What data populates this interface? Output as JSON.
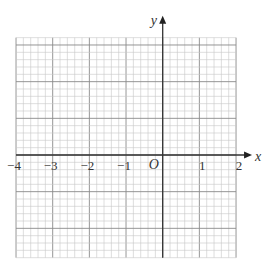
{
  "diagram": {
    "type": "coordinate-grid",
    "x_axis": {
      "label": "x",
      "min": -4,
      "max": 2,
      "ticks": [
        "-4",
        "-3",
        "-2",
        "-1",
        "1",
        "2"
      ]
    },
    "y_axis": {
      "label": "y",
      "min": -2.8,
      "max": 3.2
    },
    "origin_label": "O",
    "minor_divisions_per_unit": 5
  },
  "colors": {
    "minor_grid": "#c8c8c8",
    "major_grid": "#8a8a8a",
    "axis": "#333333",
    "text": "#333333"
  }
}
